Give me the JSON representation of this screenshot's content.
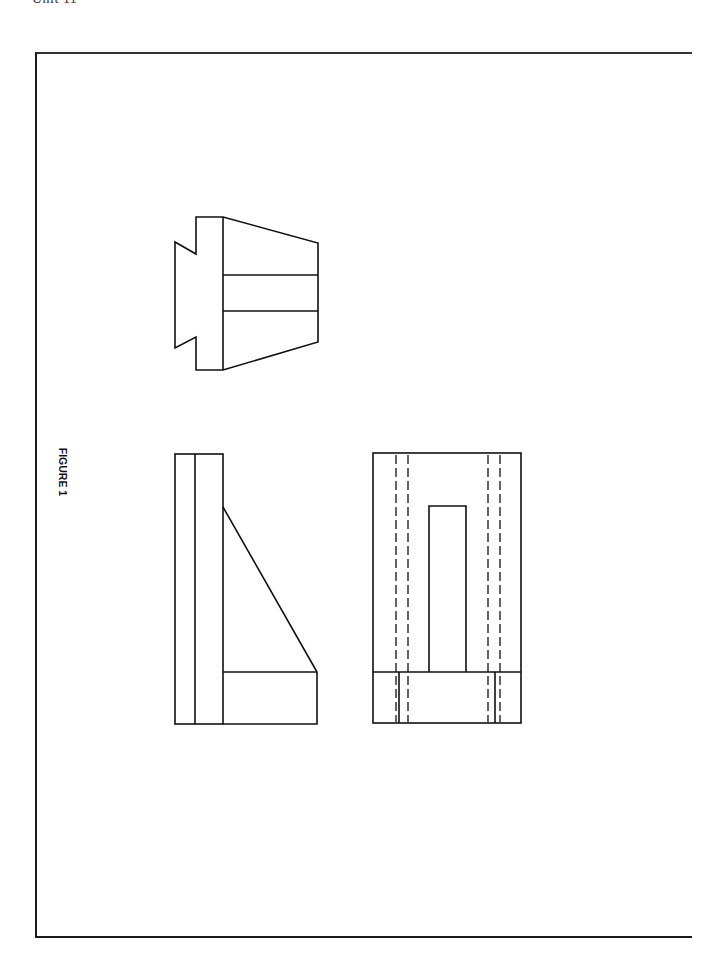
{
  "page": {
    "header": "Unit 11",
    "figure_label": "FIGURE 1"
  },
  "drawing": {
    "type": "orthographic projection",
    "views": [
      {
        "name": "top-view",
        "description": "dovetail base with tapered block, two horizontal lines"
      },
      {
        "name": "side-view",
        "description": "upright plate with triangular rib and base"
      },
      {
        "name": "front-view",
        "description": "rectangle with hidden dashed lines and central slot"
      }
    ],
    "colors": {
      "line": "#111111",
      "background": "#ffffff"
    }
  }
}
